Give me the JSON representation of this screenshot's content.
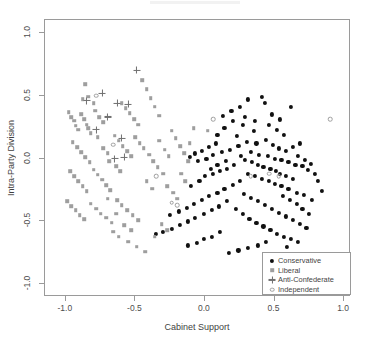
{
  "chart_data": {
    "type": "scatter",
    "title": "",
    "xlabel": "Cabinet Support",
    "ylabel": "Intra-Party Division",
    "xlim": [
      -1.15,
      1.05
    ],
    "ylim": [
      -1.1,
      1.1
    ],
    "xticks": [
      -1.0,
      -0.5,
      0.0,
      0.5,
      1.0
    ],
    "xticklabels": [
      "-1.0",
      "-0.5",
      "0.0",
      "0.5",
      "1.0"
    ],
    "yticks": [
      1.0,
      0.5,
      0.0,
      -0.5,
      -1.0
    ],
    "yticklabels": [
      "1.0",
      "0.5",
      "0.0",
      "-0.5",
      "-1.0"
    ],
    "grid": false,
    "legend_position": "bottom-right",
    "series": [
      {
        "name": "Conservative",
        "marker": "filled-circle",
        "color": "#111111",
        "points": [
          [
            0.31,
            0.47
          ],
          [
            0.41,
            0.49
          ],
          [
            0.62,
            0.41
          ],
          [
            0.27,
            0.27
          ],
          [
            0.35,
            0.22
          ],
          [
            0.2,
            0.3
          ],
          [
            0.14,
            0.24
          ],
          [
            0.09,
            0.19
          ],
          [
            0.46,
            0.27
          ],
          [
            0.52,
            0.23
          ],
          [
            0.57,
            0.19
          ],
          [
            0.44,
            0.15
          ],
          [
            0.37,
            0.12
          ],
          [
            0.3,
            0.13
          ],
          [
            0.24,
            0.1
          ],
          [
            0.18,
            0.07
          ],
          [
            0.12,
            0.05
          ],
          [
            0.06,
            0.03
          ],
          [
            0.01,
            0.0
          ],
          [
            -0.05,
            -0.02
          ],
          [
            0.33,
            0.05
          ],
          [
            0.39,
            0.03
          ],
          [
            0.45,
            0.02
          ],
          [
            0.5,
            0.0
          ],
          [
            0.55,
            -0.01
          ],
          [
            0.6,
            -0.03
          ],
          [
            0.65,
            -0.05
          ],
          [
            0.7,
            -0.06
          ],
          [
            0.74,
            -0.09
          ],
          [
            0.79,
            -0.12
          ],
          [
            0.26,
            0.02
          ],
          [
            0.29,
            -0.01
          ],
          [
            0.34,
            -0.03
          ],
          [
            0.38,
            -0.05
          ],
          [
            0.42,
            -0.07
          ],
          [
            0.47,
            -0.08
          ],
          [
            0.51,
            -0.1
          ],
          [
            0.54,
            -0.12
          ],
          [
            0.58,
            -0.14
          ],
          [
            0.63,
            -0.16
          ],
          [
            0.21,
            -0.05
          ],
          [
            0.16,
            -0.08
          ],
          [
            0.11,
            -0.1
          ],
          [
            0.06,
            -0.12
          ],
          [
            0.0,
            -0.14
          ],
          [
            0.31,
            -0.12
          ],
          [
            0.36,
            -0.14
          ],
          [
            0.41,
            -0.16
          ],
          [
            0.46,
            -0.18
          ],
          [
            0.5,
            -0.2
          ],
          [
            0.55,
            -0.22
          ],
          [
            0.6,
            -0.24
          ],
          [
            0.66,
            -0.27
          ],
          [
            0.71,
            -0.29
          ],
          [
            0.77,
            -0.33
          ],
          [
            0.25,
            -0.18
          ],
          [
            0.2,
            -0.21
          ],
          [
            0.14,
            -0.24
          ],
          [
            0.09,
            -0.27
          ],
          [
            0.03,
            -0.3
          ],
          [
            -0.02,
            -0.33
          ],
          [
            -0.08,
            -0.36
          ],
          [
            -0.13,
            -0.39
          ],
          [
            -0.19,
            -0.42
          ],
          [
            -0.25,
            -0.45
          ],
          [
            0.28,
            -0.28
          ],
          [
            0.33,
            -0.31
          ],
          [
            0.38,
            -0.34
          ],
          [
            0.43,
            -0.37
          ],
          [
            0.48,
            -0.4
          ],
          [
            0.53,
            -0.43
          ],
          [
            0.58,
            -0.46
          ],
          [
            0.63,
            -0.49
          ],
          [
            0.68,
            -0.52
          ],
          [
            0.73,
            -0.55
          ],
          [
            0.16,
            -0.34
          ],
          [
            0.1,
            -0.38
          ],
          [
            0.05,
            -0.41
          ],
          [
            -0.01,
            -0.44
          ],
          [
            -0.07,
            -0.47
          ],
          [
            0.22,
            -0.4
          ],
          [
            0.27,
            -0.44
          ],
          [
            0.32,
            -0.48
          ],
          [
            0.37,
            -0.51
          ],
          [
            0.42,
            -0.54
          ],
          [
            0.47,
            -0.57
          ],
          [
            0.52,
            -0.6
          ],
          [
            0.57,
            -0.62
          ],
          [
            0.62,
            -0.64
          ],
          [
            0.67,
            -0.66
          ],
          [
            -0.12,
            -0.5
          ],
          [
            -0.18,
            -0.53
          ],
          [
            -0.24,
            -0.56
          ],
          [
            -0.3,
            -0.58
          ],
          [
            -0.35,
            -0.6
          ],
          [
            0.13,
            0.34
          ],
          [
            0.19,
            0.38
          ],
          [
            0.25,
            0.41
          ],
          [
            0.48,
            0.35
          ],
          [
            0.54,
            0.31
          ],
          [
            0.08,
            0.12
          ],
          [
            0.03,
            0.09
          ],
          [
            -0.02,
            0.06
          ],
          [
            -0.07,
            0.04
          ],
          [
            -0.11,
            0.01
          ],
          [
            0.67,
            0.02
          ],
          [
            0.72,
            -0.01
          ],
          [
            0.76,
            -0.04
          ],
          [
            0.81,
            -0.18
          ],
          [
            0.84,
            -0.26
          ],
          [
            0.44,
            -0.66
          ],
          [
            0.38,
            -0.69
          ],
          [
            0.31,
            -0.71
          ],
          [
            0.24,
            -0.73
          ],
          [
            0.17,
            -0.75
          ],
          [
            0.05,
            -0.62
          ],
          [
            -0.01,
            -0.64
          ],
          [
            -0.06,
            -0.67
          ],
          [
            -0.12,
            -0.69
          ],
          [
            0.11,
            -0.58
          ],
          [
            0.7,
            -0.4
          ],
          [
            0.75,
            -0.44
          ],
          [
            0.66,
            -0.36
          ],
          [
            0.61,
            -0.33
          ],
          [
            0.56,
            -0.3
          ],
          [
            0.49,
            0.11
          ],
          [
            0.53,
            0.08
          ],
          [
            0.58,
            0.06
          ],
          [
            0.63,
            0.09
          ],
          [
            0.68,
            0.12
          ],
          [
            0.15,
            -0.02
          ],
          [
            0.09,
            -0.05
          ],
          [
            0.04,
            -0.08
          ],
          [
            -0.04,
            -0.18
          ],
          [
            -0.1,
            -0.22
          ],
          [
            0.23,
            0.18
          ],
          [
            0.29,
            0.33
          ],
          [
            0.36,
            0.3
          ],
          [
            0.43,
            0.44
          ],
          [
            0.59,
            -0.7
          ]
        ]
      },
      {
        "name": "Liberal",
        "marker": "square",
        "color": "#9e9e9e",
        "points": [
          [
            -0.98,
            0.37
          ],
          [
            -0.96,
            0.33
          ],
          [
            -0.94,
            0.3
          ],
          [
            -0.93,
            0.26
          ],
          [
            -0.91,
            0.23
          ],
          [
            -0.89,
            0.35
          ],
          [
            -0.87,
            0.31
          ],
          [
            -0.85,
            0.27
          ],
          [
            -0.84,
            0.24
          ],
          [
            -0.82,
            0.2
          ],
          [
            -0.88,
            0.47
          ],
          [
            -0.84,
            0.49
          ],
          [
            -0.79,
            0.38
          ],
          [
            -0.76,
            0.33
          ],
          [
            -0.73,
            0.29
          ],
          [
            -0.95,
            0.13
          ],
          [
            -0.92,
            0.09
          ],
          [
            -0.89,
            0.05
          ],
          [
            -0.86,
            0.01
          ],
          [
            -0.83,
            -0.03
          ],
          [
            -0.97,
            -0.1
          ],
          [
            -0.94,
            -0.14
          ],
          [
            -0.91,
            -0.18
          ],
          [
            -0.88,
            -0.22
          ],
          [
            -0.85,
            -0.26
          ],
          [
            -0.8,
            -0.09
          ],
          [
            -0.77,
            -0.13
          ],
          [
            -0.74,
            -0.17
          ],
          [
            -0.71,
            -0.21
          ],
          [
            -0.68,
            -0.25
          ],
          [
            -0.99,
            -0.34
          ],
          [
            -0.96,
            -0.38
          ],
          [
            -0.93,
            -0.41
          ],
          [
            -0.9,
            -0.45
          ],
          [
            -0.87,
            -0.48
          ],
          [
            -0.82,
            -0.36
          ],
          [
            -0.78,
            -0.4
          ],
          [
            -0.75,
            -0.44
          ],
          [
            -0.71,
            -0.47
          ],
          [
            -0.67,
            -0.51
          ],
          [
            -0.63,
            -0.33
          ],
          [
            -0.6,
            -0.37
          ],
          [
            -0.56,
            -0.41
          ],
          [
            -0.52,
            -0.45
          ],
          [
            -0.48,
            -0.49
          ],
          [
            -0.65,
            0.18
          ],
          [
            -0.62,
            0.14
          ],
          [
            -0.59,
            0.1
          ],
          [
            -0.56,
            0.06
          ],
          [
            -0.53,
            0.02
          ],
          [
            -0.6,
            0.44
          ],
          [
            -0.57,
            0.4
          ],
          [
            -0.54,
            0.36
          ],
          [
            -0.51,
            0.31
          ],
          [
            -0.48,
            0.27
          ],
          [
            -0.45,
            0.62
          ],
          [
            -0.42,
            0.55
          ],
          [
            -0.39,
            0.48
          ],
          [
            -0.36,
            0.41
          ],
          [
            -0.33,
            0.34
          ],
          [
            -0.44,
            0.08
          ],
          [
            -0.4,
            0.03
          ],
          [
            -0.37,
            -0.02
          ],
          [
            -0.34,
            -0.07
          ],
          [
            -0.3,
            -0.12
          ],
          [
            -0.27,
            -0.22
          ],
          [
            -0.23,
            -0.27
          ],
          [
            -0.2,
            -0.32
          ],
          [
            -0.42,
            -0.18
          ],
          [
            -0.38,
            -0.24
          ],
          [
            -0.66,
            -0.58
          ],
          [
            -0.62,
            -0.62
          ],
          [
            -0.55,
            -0.66
          ],
          [
            -0.49,
            -0.7
          ],
          [
            -0.43,
            -0.74
          ],
          [
            -0.31,
            -0.52
          ],
          [
            -0.27,
            -0.57
          ],
          [
            -0.36,
            -0.62
          ],
          [
            -0.58,
            -0.53
          ],
          [
            -0.53,
            -0.57
          ],
          [
            -0.73,
            0.08
          ],
          [
            -0.7,
            0.04
          ],
          [
            -0.69,
            -0.02
          ],
          [
            -0.64,
            -0.06
          ],
          [
            -0.61,
            -0.1
          ],
          [
            -0.24,
            0.22
          ],
          [
            -0.21,
            0.16
          ],
          [
            -0.18,
            0.1
          ],
          [
            -0.15,
            0.04
          ],
          [
            -0.12,
            -0.02
          ],
          [
            -0.29,
            0.07
          ],
          [
            -0.26,
            0.02
          ],
          [
            -0.33,
            0.14
          ],
          [
            -0.17,
            -0.12
          ],
          [
            -0.14,
            -0.18
          ],
          [
            -0.86,
            0.59
          ],
          [
            -0.8,
            0.44
          ],
          [
            -0.77,
            0.17
          ],
          [
            -0.7,
            -0.32
          ],
          [
            -0.64,
            -0.44
          ],
          [
            -0.5,
            0.17
          ],
          [
            -0.47,
            0.12
          ],
          [
            -0.11,
            0.12
          ],
          [
            -0.08,
            0.24
          ],
          [
            0.02,
            0.22
          ]
        ]
      },
      {
        "name": "Anti-Confederate",
        "marker": "plus",
        "color": "#6f6f6f",
        "points": [
          [
            -0.49,
            0.7
          ],
          [
            -0.74,
            0.52
          ],
          [
            -0.63,
            0.44
          ],
          [
            -0.55,
            0.43
          ],
          [
            -0.78,
            0.23
          ],
          [
            -0.6,
            0.16
          ],
          [
            -0.65,
            0.0
          ],
          [
            -0.58,
            0.01
          ],
          [
            -0.85,
            0.46
          ],
          [
            -0.7,
            0.33
          ]
        ]
      },
      {
        "name": "Independent",
        "marker": "open-circle",
        "color": "#9e9e9e",
        "points": [
          [
            0.06,
            0.31
          ],
          [
            -0.35,
            -0.14
          ],
          [
            0.46,
            -0.12
          ],
          [
            0.53,
            -0.14
          ],
          [
            -0.78,
            0.5
          ],
          [
            -0.66,
            0.11
          ],
          [
            -0.2,
            -0.37
          ],
          [
            -0.24,
            -0.35
          ],
          [
            0.9,
            0.31
          ],
          [
            0.33,
            -0.14
          ]
        ]
      }
    ]
  },
  "legend": {
    "entries": [
      {
        "label": "Conservative"
      },
      {
        "label": "Liberal"
      },
      {
        "label": "Anti-Confederate"
      },
      {
        "label": "Independent"
      }
    ]
  }
}
